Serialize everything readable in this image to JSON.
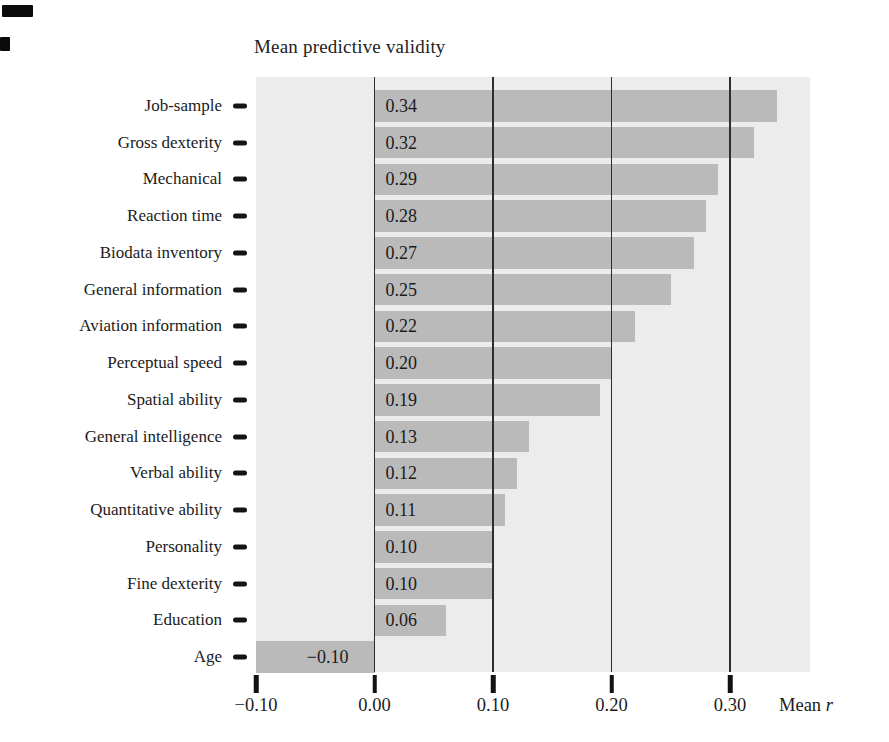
{
  "title": "Mean predictive validity",
  "chart_data": {
    "type": "bar",
    "orientation": "horizontal",
    "title": "Mean predictive validity",
    "categories": [
      "Job-sample",
      "Gross dexterity",
      "Mechanical",
      "Reaction time",
      "Biodata inventory",
      "General information",
      "Aviation information",
      "Perceptual speed",
      "Spatial ability",
      "General intelligence",
      "Verbal ability",
      "Quantitative ability",
      "Personality",
      "Fine dexterity",
      "Education",
      "Age"
    ],
    "values": [
      0.34,
      0.32,
      0.29,
      0.28,
      0.27,
      0.25,
      0.22,
      0.2,
      0.19,
      0.13,
      0.12,
      0.11,
      0.1,
      0.1,
      0.06,
      -0.1
    ],
    "bar_labels": [
      "0.34",
      "0.32",
      "0.29",
      "0.28",
      "0.27",
      "0.25",
      "0.22",
      "0.20",
      "0.19",
      "0.13",
      "0.12",
      "0.11",
      "0.10",
      "0.10",
      "0.06",
      "−0.10"
    ],
    "xlabel_text": "Mean",
    "xlabel_var": "r",
    "xlim": [
      -0.1,
      0.3675
    ],
    "xticks": [
      -0.1,
      0.0,
      0.1,
      0.2,
      0.3
    ],
    "xtick_labels": [
      "−0.10",
      "0.00",
      "0.10",
      "0.20",
      "0.30"
    ],
    "gridlines": [
      0.0,
      0.1,
      0.2,
      0.3
    ],
    "grid": "vertical-lines-over-bars",
    "legend": "none",
    "colors": {
      "bar": "#bababa",
      "plot_background": "#edecec",
      "gridline": "#2e2e2e",
      "text": "#1b1b1b",
      "page_background": "#ffffff"
    }
  }
}
